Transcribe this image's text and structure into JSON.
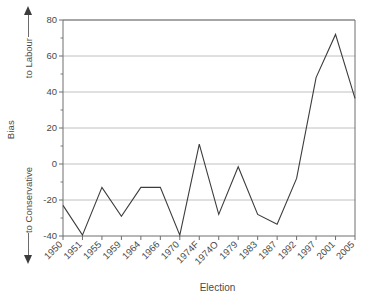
{
  "chart_data": {
    "type": "line",
    "title": "",
    "xlabel": "Election",
    "ylabel": "Bias",
    "ylabel_top": "to Labour",
    "ylabel_bottom": "to Conservative",
    "categories": [
      "1950",
      "1951",
      "1955",
      "1959",
      "1964",
      "1966",
      "1970",
      "1974F",
      "1974O",
      "1979",
      "1983",
      "1987",
      "1992",
      "1997",
      "2001",
      "2005"
    ],
    "values": [
      -23,
      -39.5,
      -13,
      -29,
      -13,
      -13,
      -39.5,
      11,
      -28,
      -1.5,
      -28,
      -33.5,
      -8,
      48,
      72,
      36.5
    ],
    "series": [
      {
        "name": "Bias",
        "values": [
          -23,
          -39.5,
          -13,
          -29,
          -13,
          -13,
          -39.5,
          11,
          -28,
          -1.5,
          -28,
          -33.5,
          -8,
          48,
          72,
          36.5
        ]
      }
    ],
    "ylim": [
      -40,
      80
    ],
    "ytick_labels": [
      "80",
      "60",
      "40",
      "20",
      "0",
      "-20",
      "-40"
    ],
    "ytick_values": [
      80,
      60,
      40,
      20,
      0,
      -20,
      -40
    ],
    "yminor_values": [
      70,
      50,
      30,
      10,
      -10,
      -30
    ],
    "grid": true,
    "grid_axis": "y",
    "legend": "none",
    "line_color": "#3c3c3c",
    "grid_color": "#b9b9b9",
    "axis_color": "#6e6e6e",
    "text_color": "#4a4a4a",
    "xtick_rotation": -45
  },
  "axis_icons": {
    "up_arrow": "arrow-up-icon",
    "down_arrow": "arrow-down-icon"
  }
}
